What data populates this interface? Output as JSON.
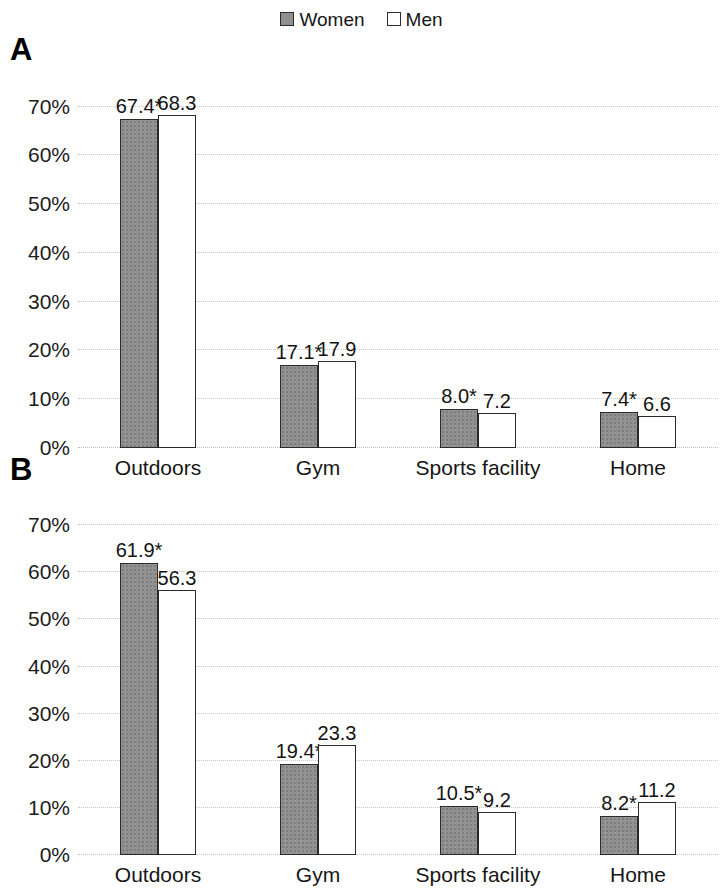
{
  "legend": {
    "entries": [
      {
        "label": "Women",
        "swatch": "filled-gray-square",
        "color": "#919191"
      },
      {
        "label": "Men",
        "swatch": "open-white-square",
        "color": "#ffffff"
      }
    ]
  },
  "panels": [
    {
      "letter": "A"
    },
    {
      "letter": "B"
    }
  ],
  "axis": {
    "ticks": [
      "70%",
      "60%",
      "50%",
      "40%",
      "30%",
      "20%",
      "10%",
      "0%"
    ],
    "tick_values": [
      70,
      60,
      50,
      40,
      30,
      20,
      10,
      0
    ]
  },
  "chart_data": [
    {
      "type": "bar",
      "title": "A",
      "xlabel": "",
      "ylabel": "",
      "ylim": [
        0,
        73
      ],
      "grid": true,
      "legend_position": "top-center",
      "categories": [
        "Outdoors",
        "Gym",
        "Sports facility",
        "Home"
      ],
      "series": [
        {
          "name": "Women",
          "values": [
            67.4,
            17.1,
            8.0,
            7.4
          ],
          "labels": [
            "67.4*",
            "17.1*",
            "8.0*",
            "7.4*"
          ]
        },
        {
          "name": "Men",
          "values": [
            68.3,
            17.9,
            7.2,
            6.6
          ],
          "labels": [
            "68.3",
            "17.9",
            "7.2",
            "6.6"
          ]
        }
      ]
    },
    {
      "type": "bar",
      "title": "B",
      "xlabel": "",
      "ylabel": "",
      "ylim": [
        0,
        73
      ],
      "grid": true,
      "legend_position": "top-center",
      "categories": [
        "Outdoors",
        "Gym",
        "Sports facility",
        "Home"
      ],
      "series": [
        {
          "name": "Women",
          "values": [
            61.9,
            19.4,
            10.5,
            8.2
          ],
          "labels": [
            "61.9*",
            "19.4*",
            "10.5*",
            "8.2*"
          ]
        },
        {
          "name": "Men",
          "values": [
            56.3,
            23.3,
            9.2,
            11.2
          ],
          "labels": [
            "56.3",
            "23.3",
            "9.2",
            "11.2"
          ]
        }
      ]
    }
  ]
}
